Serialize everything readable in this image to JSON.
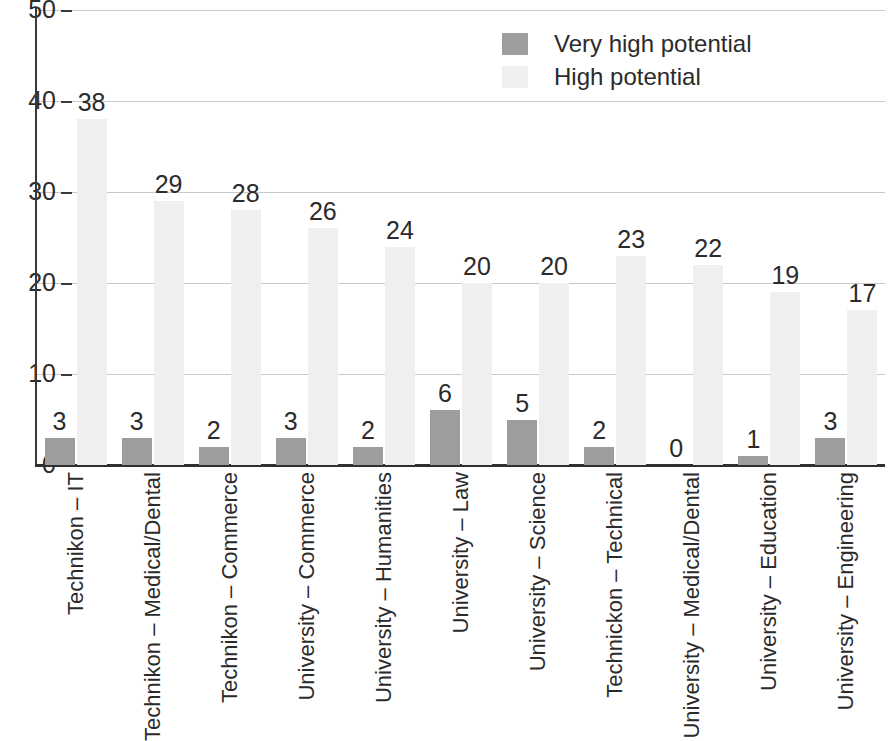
{
  "chart_data": {
    "type": "bar",
    "title": "",
    "subtitle": "",
    "xlabel": "",
    "ylabel": "",
    "ylim": [
      0,
      50
    ],
    "yticks": [
      0,
      10,
      20,
      30,
      40,
      50
    ],
    "grid": true,
    "legend_position": "top-center",
    "orientation": "vertical",
    "grouping": "grouped",
    "categories": [
      "Technikon – IT",
      "Technikon – Medical/Dental",
      "Technikon – Commerce",
      "University – Commerce",
      "University – Humanities",
      "University – Law",
      "University – Science",
      "Technickon – Technical",
      "University – Medical/Dental",
      "University – Education",
      "University – Engineering"
    ],
    "series": [
      {
        "name": "Very high potential",
        "color": "#9d9d9d",
        "values": [
          3,
          3,
          2,
          3,
          2,
          6,
          5,
          2,
          0,
          1,
          3
        ]
      },
      {
        "name": "High potential",
        "color": "#efefef",
        "values": [
          38,
          29,
          28,
          26,
          24,
          20,
          20,
          23,
          22,
          19,
          17
        ]
      }
    ]
  },
  "legend": {
    "items": [
      {
        "label": "Very high potential",
        "swatch_class": "very"
      },
      {
        "label": "High potential",
        "swatch_class": "high"
      }
    ]
  },
  "axis": {
    "y_tick_labels": [
      "50",
      "40",
      "30",
      "20",
      "10",
      "0"
    ]
  },
  "colors": {
    "very_high": "#9d9d9d",
    "high": "#efefef",
    "axis": "#2f2f2f",
    "grid": "#c9c9c9",
    "text": "#2b2b2b",
    "background": "#ffffff"
  }
}
